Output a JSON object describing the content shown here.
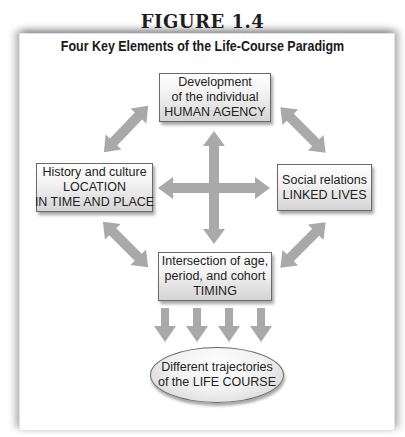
{
  "figure": {
    "label": "FIGURE 1.4",
    "title": "Four Key Elements of the Life-Course Paradigm"
  },
  "nodes": {
    "top": {
      "lines": [
        "Development",
        "of the individual",
        "HUMAN AGENCY"
      ]
    },
    "left": {
      "lines": [
        "History and culture",
        "LOCATION",
        "IN TIME AND PLACE"
      ]
    },
    "right": {
      "lines": [
        "Social relations",
        "LINKED LIVES"
      ]
    },
    "bottom": {
      "lines": [
        "Intersection of age,",
        "period, and cohort",
        "TIMING"
      ]
    },
    "outcome": {
      "lines": [
        "Different trajectories",
        "of the LIFE COURSE"
      ]
    }
  },
  "arrows": {
    "color": "#a9a9a9",
    "double_headed": [
      {
        "name": "top-left-diagonal",
        "from": [
          104,
          152
        ],
        "to": [
          148,
          106
        ]
      },
      {
        "name": "top-right-diagonal",
        "from": [
          281,
          108
        ],
        "to": [
          325,
          152
        ]
      },
      {
        "name": "bottom-left-diagonal",
        "from": [
          104,
          223
        ],
        "to": [
          147,
          266
        ]
      },
      {
        "name": "bottom-right-diagonal",
        "from": [
          281,
          267
        ],
        "to": [
          325,
          223
        ]
      },
      {
        "name": "center-vertical",
        "from": [
          214,
          131
        ],
        "to": [
          214,
          244
        ]
      },
      {
        "name": "center-horizontal",
        "from": [
          158,
          188
        ],
        "to": [
          270,
          188
        ]
      }
    ],
    "down_arrow_count": 4
  }
}
